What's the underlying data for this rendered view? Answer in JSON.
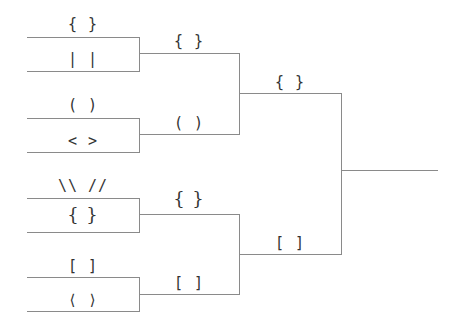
{
  "bracket": {
    "round1": [
      {
        "top": "{ }",
        "bottom": "| |"
      },
      {
        "top": "( )",
        "bottom": "< >"
      },
      {
        "top": "\\\\ //",
        "bottom": "{ }"
      },
      {
        "top": "[ ]",
        "bottom": "⟨ ⟩"
      }
    ],
    "round2": [
      "{ }",
      "( )",
      "{ }",
      "[ ]"
    ],
    "round3": [
      "{ }",
      "[ ]"
    ]
  }
}
